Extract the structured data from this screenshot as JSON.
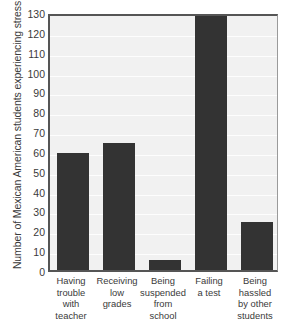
{
  "chart_data": {
    "type": "bar",
    "title": "",
    "xlabel": "",
    "ylabel": "Number of Mexican American students experiencing stress",
    "categories": [
      "Having trouble with teacher",
      "Receiving low grades",
      "Being suspended from school",
      "Failing a test",
      "Being hassled by other students"
    ],
    "category_lines": [
      [
        "Having",
        "trouble",
        "with",
        "teacher"
      ],
      [
        "Receiving",
        "low",
        "grades"
      ],
      [
        "Being",
        "suspended",
        "from",
        "school"
      ],
      [
        "Failing",
        "a test"
      ],
      [
        "Being",
        "hassled",
        "by other",
        "students"
      ]
    ],
    "values": [
      59,
      64,
      5,
      128,
      24
    ],
    "ylim": [
      0,
      130
    ],
    "ytick_step": 10,
    "yticks": [
      0,
      10,
      20,
      30,
      40,
      50,
      60,
      70,
      80,
      90,
      100,
      110,
      120,
      130
    ],
    "grid": true,
    "legend": false,
    "bar_color": "#333333",
    "plot_background": "#f1f1f1",
    "axis_color": "#555555",
    "gridline_color": "#fdfdfd"
  }
}
